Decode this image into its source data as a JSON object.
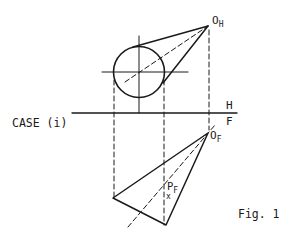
{
  "figure": {
    "case_label": "CASE (i)",
    "fig_label": "Fig. 1",
    "plane_labels": {
      "top": "H",
      "bottom": "F"
    },
    "points": {
      "o_h": {
        "main": "O",
        "sub": "H"
      },
      "o_f": {
        "main": "O",
        "sub": "F"
      },
      "p_f": {
        "main": "P",
        "sub": "F",
        "marker": "x"
      }
    },
    "colors": {
      "line": "#1a1a1a",
      "background": "#ffffff"
    }
  }
}
